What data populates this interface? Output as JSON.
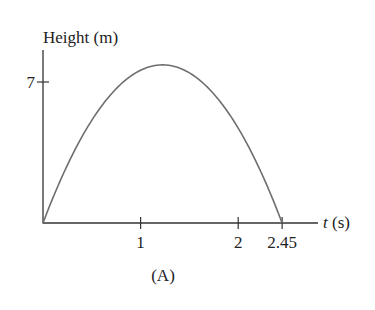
{
  "chart_data": {
    "type": "line",
    "title": "",
    "ylabel": "Height (m)",
    "xlabel_var": "t",
    "xlabel_unit": " (s)",
    "x_ticks": [
      {
        "value": 1,
        "label": "1"
      },
      {
        "value": 2,
        "label": "2"
      },
      {
        "value": 2.45,
        "label": "2.45"
      }
    ],
    "y_ticks": [
      {
        "value": 7,
        "label": "7"
      }
    ],
    "xlim": [
      0,
      2.8
    ],
    "ylim": [
      0,
      8.6
    ],
    "series": [
      {
        "name": "height",
        "description": "parabolic trajectory starting at 0, peaking near 7.9 m around t=1.22 s, returning to 0 at t=2.45 s",
        "x": [
          0,
          0.25,
          0.5,
          0.75,
          1.0,
          1.225,
          1.5,
          1.75,
          2.0,
          2.25,
          2.45
        ],
        "y": [
          0,
          2.86,
          5.07,
          6.63,
          7.54,
          7.85,
          7.41,
          6.37,
          4.68,
          2.34,
          0
        ]
      }
    ],
    "grid": false,
    "legend": null,
    "caption": "(A)"
  },
  "colors": {
    "axis": "#333333",
    "curve": "#6e6e6e",
    "text": "#222222"
  }
}
